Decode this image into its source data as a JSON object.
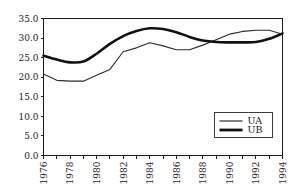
{
  "chart_data": {
    "type": "line",
    "title": "",
    "subtitle": "",
    "xlabel": "",
    "ylabel": "",
    "x": [
      1976,
      1977,
      1978,
      1979,
      1980,
      1981,
      1982,
      1983,
      1984,
      1985,
      1986,
      1987,
      1988,
      1989,
      1990,
      1991,
      1992,
      1993,
      1994
    ],
    "xlim": [
      1976,
      1994
    ],
    "ylim": [
      0.0,
      35.0
    ],
    "grid": false,
    "legend_position": "bottom-right",
    "series": [
      {
        "name": "UA",
        "style": "thin-line",
        "values": [
          20.8,
          19.2,
          19.0,
          19.0,
          20.5,
          22.0,
          26.5,
          27.5,
          28.8,
          28.0,
          27.0,
          27.0,
          28.2,
          29.6,
          31.0,
          31.7,
          32.0,
          32.0,
          31.0
        ]
      },
      {
        "name": "UB",
        "style": "thick-line",
        "values": [
          25.5,
          24.5,
          23.8,
          24.0,
          26.0,
          28.5,
          30.5,
          31.8,
          32.5,
          32.3,
          31.5,
          30.3,
          29.4,
          29.0,
          28.9,
          28.9,
          29.0,
          29.8,
          31.2
        ]
      }
    ],
    "y_ticks": [
      0.0,
      5.0,
      10.0,
      15.0,
      20.0,
      25.0,
      30.0,
      35.0
    ],
    "y_tick_labels": [
      "0.0",
      "5.0",
      "10.0",
      "15.0",
      "20.0",
      "25.0",
      "30.0",
      "35.0"
    ],
    "x_ticks": [
      1976,
      1977,
      1978,
      1979,
      1980,
      1981,
      1982,
      1983,
      1984,
      1985,
      1986,
      1987,
      1988,
      1989,
      1990,
      1991,
      1992,
      1993,
      1994
    ],
    "x_tick_labels": [
      "1976",
      "",
      "1978",
      "",
      "1980",
      "",
      "1982",
      "",
      "1984",
      "",
      "1986",
      "",
      "1988",
      "",
      "1990",
      "",
      "1992",
      "",
      "1994"
    ],
    "colors": {
      "series_ua": "#2b2b2b",
      "series_ub": "#111111",
      "axis": "#1a1a1a",
      "background": "#ffffff"
    }
  },
  "legend": {
    "entries": [
      {
        "label": "UA"
      },
      {
        "label": "UB"
      }
    ]
  }
}
